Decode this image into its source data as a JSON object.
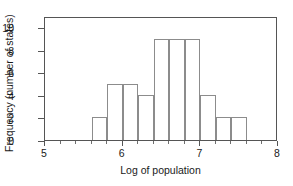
{
  "chart_data": {
    "type": "bar",
    "title": "",
    "subtitle": "",
    "xlabel": "Log of population",
    "ylabel": "Frequency (number of states)",
    "xlim": [
      5,
      8
    ],
    "ylim": [
      0,
      11
    ],
    "bin_width": 0.2,
    "grid": false,
    "legend": null,
    "x_major_ticks": [
      5,
      6,
      7,
      8
    ],
    "x_major_tick_labels": [
      "5",
      "6",
      "7",
      "8"
    ],
    "x_minor_ticks": [
      5.2,
      5.4,
      5.6,
      5.8,
      6.2,
      6.4,
      6.6,
      6.8,
      7.2,
      7.4,
      7.6,
      7.8
    ],
    "y_ticks": [
      0,
      2,
      4,
      6,
      8,
      10
    ],
    "y_tick_labels": [
      "0",
      "2",
      "4",
      "6",
      "8",
      "10"
    ],
    "categories": [
      "5.6-5.8",
      "5.8-6.0",
      "6.0-6.2",
      "6.2-6.4",
      "6.4-6.6",
      "6.6-6.8",
      "6.8-7.0",
      "7.0-7.2",
      "7.2-7.4",
      "7.4-7.6"
    ],
    "bin_starts": [
      5.6,
      5.8,
      6.0,
      6.2,
      6.4,
      6.6,
      6.8,
      7.0,
      7.2,
      7.4
    ],
    "bin_ends": [
      5.8,
      6.0,
      6.2,
      6.4,
      6.6,
      6.8,
      7.0,
      7.2,
      7.4,
      7.6
    ],
    "values": [
      2,
      5,
      5,
      4,
      9,
      9,
      9,
      4,
      2,
      2
    ],
    "bar_fill_color": "#ffffff",
    "bar_edge_color": "#8c8c8c",
    "axis_color": "#555555",
    "background_color": "#ffffff"
  }
}
